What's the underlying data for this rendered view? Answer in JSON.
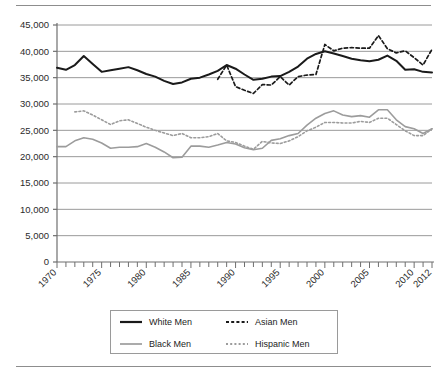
{
  "chart_data": {
    "type": "line",
    "title": "",
    "subtitle": "",
    "xlabel": "",
    "ylabel": "",
    "xlim": [
      1970,
      2012
    ],
    "ylim": [
      0,
      45000
    ],
    "grid": true,
    "gridlines_horizontal": true,
    "legend_position": "bottom",
    "y_ticks": [
      0,
      5000,
      10000,
      15000,
      20000,
      25000,
      30000,
      35000,
      40000,
      45000
    ],
    "y_tick_labels": [
      "0",
      "5,000",
      "10,000",
      "15,000",
      "20,000",
      "25,000",
      "30,000",
      "35,000",
      "40,000",
      "45,000"
    ],
    "x_ticks": [
      1970,
      1975,
      1980,
      1985,
      1990,
      1995,
      2000,
      2005,
      2010,
      2012
    ],
    "x_tick_labels": [
      "1970",
      "1975",
      "1980",
      "1985",
      "1990",
      "1995",
      "2000",
      "2005",
      "2010",
      "2012"
    ],
    "x_minor_tick_step": 1,
    "series": [
      {
        "name": "White Men",
        "style": "solid",
        "color": "#1a1a1a",
        "width": 2.0,
        "x": [
          1970,
          1971,
          1972,
          1973,
          1974,
          1975,
          1976,
          1977,
          1978,
          1979,
          1980,
          1981,
          1982,
          1983,
          1984,
          1985,
          1986,
          1987,
          1988,
          1989,
          1990,
          1991,
          1992,
          1993,
          1994,
          1995,
          1996,
          1997,
          1998,
          1999,
          2000,
          2001,
          2002,
          2003,
          2004,
          2005,
          2006,
          2007,
          2008,
          2009,
          2010,
          2011,
          2012
        ],
        "values": [
          36900,
          36500,
          37400,
          39100,
          37600,
          36100,
          36400,
          36700,
          37000,
          36400,
          35700,
          35200,
          34400,
          33800,
          34100,
          34800,
          35000,
          35600,
          36300,
          37400,
          36700,
          35600,
          34600,
          34800,
          35200,
          35300,
          36100,
          37100,
          38600,
          39500,
          40000,
          39600,
          39100,
          38600,
          38300,
          38100,
          38400,
          39200,
          38200,
          36500,
          36600,
          36100,
          36000
        ]
      },
      {
        "name": "Black Men",
        "style": "solid",
        "color": "#9c9c9c",
        "width": 1.6,
        "x": [
          1970,
          1971,
          1972,
          1973,
          1974,
          1975,
          1976,
          1977,
          1978,
          1979,
          1980,
          1981,
          1982,
          1983,
          1984,
          1985,
          1986,
          1987,
          1988,
          1989,
          1990,
          1991,
          1992,
          1993,
          1994,
          1995,
          1996,
          1997,
          1998,
          1999,
          2000,
          2001,
          2002,
          2003,
          2004,
          2005,
          2006,
          2007,
          2008,
          2009,
          2010,
          2011,
          2012
        ],
        "values": [
          21900,
          21900,
          23000,
          23600,
          23300,
          22600,
          21600,
          21800,
          21800,
          21900,
          22500,
          21800,
          20900,
          19800,
          19900,
          22000,
          22000,
          21800,
          22200,
          22700,
          22400,
          21700,
          21300,
          21600,
          23100,
          23400,
          24000,
          24400,
          26000,
          27300,
          28200,
          28700,
          27900,
          27600,
          27800,
          27500,
          28900,
          28900,
          27000,
          25700,
          25300,
          24400,
          25300
        ]
      },
      {
        "name": "Asian Men",
        "style": "dashed",
        "color": "#1a1a1a",
        "width": 1.7,
        "x": [
          1988,
          1989,
          1990,
          1991,
          1992,
          1993,
          1994,
          1995,
          1996,
          1997,
          1998,
          1999,
          2000,
          2001,
          2002,
          2003,
          2004,
          2005,
          2006,
          2007,
          2008,
          2009,
          2010,
          2011,
          2012
        ],
        "values": [
          34700,
          37400,
          33300,
          32600,
          32000,
          33700,
          33600,
          35200,
          33600,
          35200,
          35500,
          35600,
          41300,
          40100,
          40600,
          40700,
          40600,
          40600,
          43000,
          40500,
          39700,
          40100,
          38800,
          37400,
          40400
        ]
      },
      {
        "name": "Hispanic Men",
        "style": "dotted",
        "color": "#9c9c9c",
        "width": 1.6,
        "x": [
          1972,
          1973,
          1974,
          1975,
          1976,
          1977,
          1978,
          1979,
          1980,
          1981,
          1982,
          1983,
          1984,
          1985,
          1986,
          1987,
          1988,
          1989,
          1990,
          1991,
          1992,
          1993,
          1994,
          1995,
          1996,
          1997,
          1998,
          1999,
          2000,
          2001,
          2002,
          2003,
          2004,
          2005,
          2006,
          2007,
          2008,
          2009,
          2010,
          2011,
          2012
        ],
        "values": [
          28500,
          28700,
          27900,
          27000,
          26100,
          26800,
          27000,
          26300,
          25600,
          25000,
          24500,
          24000,
          24400,
          23600,
          23600,
          23800,
          24400,
          23000,
          22700,
          22000,
          21400,
          22900,
          22600,
          22500,
          23000,
          23800,
          24900,
          25600,
          26500,
          26500,
          26400,
          26400,
          26700,
          26500,
          27300,
          27300,
          26100,
          24900,
          24000,
          24000,
          25300
        ]
      }
    ]
  },
  "legend": {
    "entries": [
      {
        "label": "White Men",
        "style": "solid",
        "color": "#1a1a1a"
      },
      {
        "label": "Asian Men",
        "style": "dashed",
        "color": "#1a1a1a"
      },
      {
        "label": "Black Men",
        "style": "solid",
        "color": "#9c9c9c"
      },
      {
        "label": "Hispanic Men",
        "style": "dotted",
        "color": "#9c9c9c"
      }
    ]
  },
  "colors": {
    "rule": "#8d8d8d",
    "gridline": "#9a9a9a",
    "axis": "#6f6f6f",
    "text": "#2b2b2b",
    "background": "#ffffff"
  }
}
